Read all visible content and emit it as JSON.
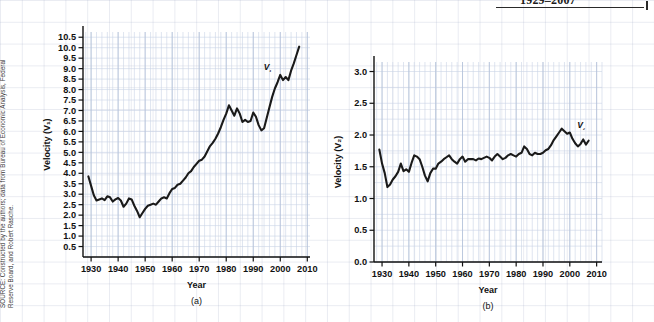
{
  "figure": {
    "title_fragment": "1929–2007",
    "source_note": "SOURCE: Constructed by the authors; data from Bureau of Economic Analysis, Federal Reserve Board, and Robert Rasche."
  },
  "chart_data": [
    {
      "id": "panel-a",
      "type": "line",
      "title": "",
      "panel_letter": "(a)",
      "xlabel": "Year",
      "ylabel": "Velocity (V₁)",
      "series_label": "V₁",
      "grid": true,
      "legend": "none",
      "xlim": [
        1927,
        2011
      ],
      "ylim": [
        0.0,
        10.75
      ],
      "xticks": [
        1930,
        1940,
        1950,
        1960,
        1970,
        1980,
        1990,
        2000,
        2010
      ],
      "xticklabels": [
        "1930",
        "1940",
        "1950",
        "1960",
        "1970",
        "1980",
        "1990",
        "2000",
        "2010"
      ],
      "yticks": [
        0.5,
        1.0,
        1.5,
        2.0,
        2.5,
        3.0,
        3.5,
        4.0,
        4.5,
        5.0,
        5.5,
        6.0,
        6.5,
        7.0,
        7.5,
        8.0,
        8.5,
        9.0,
        9.5,
        10.0,
        10.5
      ],
      "yticklabels": [
        "0.5",
        "1.0",
        "1.5",
        "2.0",
        "2.5",
        "3.0",
        "3.5",
        "4.0",
        "4.5",
        "5.0",
        "5.5",
        "6.0",
        "6.5",
        "7.0",
        "7.5",
        "8.0",
        "8.5",
        "9.0",
        "9.5",
        "10.0",
        "10.5"
      ],
      "x": [
        1929,
        1930,
        1931,
        1932,
        1933,
        1934,
        1935,
        1936,
        1937,
        1938,
        1939,
        1940,
        1941,
        1942,
        1943,
        1944,
        1945,
        1946,
        1947,
        1948,
        1949,
        1950,
        1951,
        1952,
        1953,
        1954,
        1955,
        1956,
        1957,
        1958,
        1959,
        1960,
        1961,
        1962,
        1963,
        1964,
        1965,
        1966,
        1967,
        1968,
        1969,
        1970,
        1971,
        1972,
        1973,
        1974,
        1975,
        1976,
        1977,
        1978,
        1979,
        1980,
        1981,
        1982,
        1983,
        1984,
        1985,
        1986,
        1987,
        1988,
        1989,
        1990,
        1991,
        1992,
        1993,
        1994,
        1995,
        1996,
        1997,
        1998,
        1999,
        2000,
        2001,
        2002,
        2003,
        2004,
        2005,
        2006,
        2007
      ],
      "y": [
        3.85,
        3.4,
        2.95,
        2.7,
        2.75,
        2.8,
        2.72,
        2.9,
        2.85,
        2.65,
        2.75,
        2.82,
        2.7,
        2.4,
        2.55,
        2.8,
        2.75,
        2.45,
        2.2,
        1.9,
        2.1,
        2.3,
        2.45,
        2.5,
        2.55,
        2.5,
        2.65,
        2.8,
        2.85,
        2.8,
        3.05,
        3.25,
        3.3,
        3.45,
        3.5,
        3.65,
        3.8,
        4.0,
        4.1,
        4.3,
        4.45,
        4.6,
        4.65,
        4.8,
        5.05,
        5.3,
        5.45,
        5.65,
        5.9,
        6.2,
        6.55,
        6.85,
        7.25,
        7.0,
        6.75,
        7.1,
        6.85,
        6.45,
        6.55,
        6.45,
        6.5,
        6.9,
        6.7,
        6.3,
        6.05,
        6.15,
        6.65,
        7.15,
        7.65,
        8.05,
        8.35,
        8.7,
        8.45,
        8.6,
        8.45,
        8.9,
        9.25,
        9.65,
        10.05
      ]
    },
    {
      "id": "panel-b",
      "type": "line",
      "title": "",
      "panel_letter": "(b)",
      "xlabel": "Year",
      "ylabel": "Velocity (V₂)",
      "series_label": "V₂",
      "grid": true,
      "legend": "none",
      "xlim": [
        1927,
        2012
      ],
      "ylim": [
        0.0,
        3.15
      ],
      "xticks": [
        1930,
        1940,
        1950,
        1960,
        1970,
        1980,
        1990,
        2000,
        2010
      ],
      "xticklabels": [
        "1930",
        "1940",
        "1950",
        "1960",
        "1970",
        "1980",
        "1990",
        "2000",
        "2010"
      ],
      "yticks": [
        0.0,
        0.5,
        1.0,
        1.5,
        2.0,
        2.5,
        3.0
      ],
      "yticklabels": [
        "0.0",
        "0.5",
        "1.0",
        "1.5",
        "2.0",
        "2.5",
        "3.0"
      ],
      "x": [
        1929,
        1930,
        1931,
        1932,
        1933,
        1934,
        1935,
        1936,
        1937,
        1938,
        1939,
        1940,
        1941,
        1942,
        1943,
        1944,
        1945,
        1946,
        1947,
        1948,
        1949,
        1950,
        1951,
        1952,
        1953,
        1954,
        1955,
        1956,
        1957,
        1958,
        1959,
        1960,
        1961,
        1962,
        1963,
        1964,
        1965,
        1966,
        1967,
        1968,
        1969,
        1970,
        1971,
        1972,
        1973,
        1974,
        1975,
        1976,
        1977,
        1978,
        1979,
        1980,
        1981,
        1982,
        1983,
        1984,
        1985,
        1986,
        1987,
        1988,
        1989,
        1990,
        1991,
        1992,
        1993,
        1994,
        1995,
        1996,
        1997,
        1998,
        1999,
        2000,
        2001,
        2002,
        2003,
        2004,
        2005,
        2006,
        2007
      ],
      "y": [
        1.77,
        1.55,
        1.4,
        1.18,
        1.22,
        1.3,
        1.35,
        1.42,
        1.55,
        1.43,
        1.46,
        1.42,
        1.56,
        1.68,
        1.66,
        1.62,
        1.5,
        1.36,
        1.27,
        1.4,
        1.47,
        1.47,
        1.55,
        1.58,
        1.62,
        1.65,
        1.68,
        1.62,
        1.58,
        1.55,
        1.62,
        1.66,
        1.58,
        1.62,
        1.62,
        1.62,
        1.6,
        1.63,
        1.62,
        1.64,
        1.66,
        1.64,
        1.6,
        1.66,
        1.7,
        1.66,
        1.62,
        1.64,
        1.68,
        1.7,
        1.68,
        1.66,
        1.7,
        1.72,
        1.82,
        1.78,
        1.7,
        1.68,
        1.72,
        1.7,
        1.7,
        1.72,
        1.76,
        1.78,
        1.84,
        1.92,
        1.98,
        2.04,
        2.1,
        2.06,
        2.02,
        2.04,
        1.94,
        1.87,
        1.82,
        1.86,
        1.93,
        1.85,
        1.91
      ]
    }
  ]
}
